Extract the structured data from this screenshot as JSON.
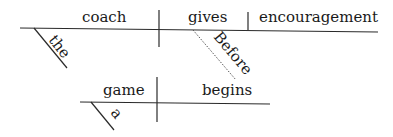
{
  "diagram": {
    "type": "Reed-Kellogg sentence diagram",
    "main_clause": {
      "subject": "coach",
      "subject_modifier": "the",
      "verb": "gives",
      "object": "encouragement"
    },
    "connector": "Before",
    "subordinate_clause": {
      "subject": "game",
      "subject_modifier": "a",
      "verb": "begins"
    }
  }
}
